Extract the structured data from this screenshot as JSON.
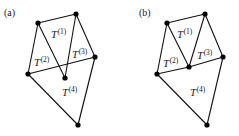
{
  "figure": {
    "panels": [
      {
        "label": "(a)",
        "label_pos": [
          4,
          16
        ],
        "vertices": [
          [
            38,
            23
          ],
          [
            76,
            14
          ],
          [
            95,
            57
          ],
          [
            28,
            74
          ],
          [
            65,
            78
          ],
          [
            78,
            125
          ]
        ],
        "edges": [
          [
            0,
            1
          ],
          [
            1,
            2
          ],
          [
            2,
            5
          ],
          [
            5,
            3
          ],
          [
            3,
            0
          ],
          [
            0,
            4
          ],
          [
            1,
            4
          ],
          [
            3,
            2
          ]
        ],
        "triangles": [
          {
            "name": "T",
            "sup": "(1)",
            "pos": [
              51,
              38
            ]
          },
          {
            "name": "T",
            "sup": "(2)",
            "pos": [
              34,
              66
            ]
          },
          {
            "name": "T",
            "sup": "(3)",
            "pos": [
              72,
              58
            ]
          },
          {
            "name": "T",
            "sup": "(4)",
            "pos": [
              62,
              96
            ]
          }
        ]
      },
      {
        "label": "(b)",
        "label_pos": [
          139,
          16
        ],
        "vertices": [
          [
            167,
            23
          ],
          [
            205,
            14
          ],
          [
            223,
            57
          ],
          [
            157,
            74
          ],
          [
            189,
            67
          ],
          [
            207,
            125
          ]
        ],
        "edges": [
          [
            0,
            1
          ],
          [
            1,
            2
          ],
          [
            2,
            5
          ],
          [
            5,
            3
          ],
          [
            3,
            0
          ],
          [
            0,
            4
          ],
          [
            1,
            4
          ],
          [
            3,
            4
          ],
          [
            4,
            2
          ]
        ],
        "triangles": [
          {
            "name": "T",
            "sup": "(1)",
            "pos": [
              177,
              38
            ]
          },
          {
            "name": "T",
            "sup": "(2)",
            "pos": [
              163,
              67
            ]
          },
          {
            "name": "T",
            "sup": "(3)",
            "pos": [
              197,
              59
            ]
          },
          {
            "name": "T",
            "sup": "(4)",
            "pos": [
              190,
              96
            ]
          }
        ]
      }
    ],
    "colors": {
      "line": "#111111",
      "vertex": "#000000",
      "text": "#222222"
    }
  }
}
